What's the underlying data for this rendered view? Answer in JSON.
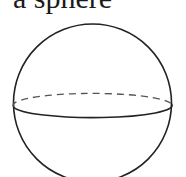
{
  "caption": "a sphere",
  "diagram": {
    "shape": "sphere",
    "outline": {
      "cx": 92.5,
      "cy": 103,
      "r": 79
    },
    "equator": {
      "cx": 92.5,
      "cy": 106,
      "rx": 79,
      "ry": 12,
      "front": "solid",
      "back": "dashed"
    },
    "stroke_color": "#222222"
  }
}
